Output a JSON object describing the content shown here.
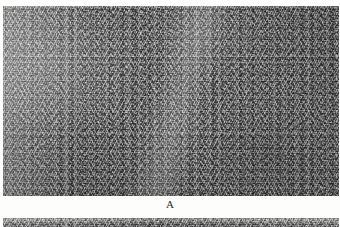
{
  "figure": {
    "kind": "histology-micrograph-figure",
    "background_color": "#fdfdfc",
    "panels": [
      {
        "id": "A",
        "label": "A",
        "role": "main-micrograph",
        "modality": "light-microscopy",
        "staining": "grayscale",
        "tissue_description": "dense interlacing spindle-cell fascicles",
        "dominant_tone": "#8a8a8a",
        "dark_tone": "#3a3a3a",
        "light_tone": "#dcdcdc",
        "bounds": {
          "x": 3,
          "y": 6,
          "width": 336,
          "height": 190
        }
      },
      {
        "id": "B",
        "label": "",
        "role": "cropped-lower-micrograph-sliver",
        "modality": "light-microscopy",
        "staining": "grayscale",
        "tissue_description": "top edge of adjacent panel, partially cut off",
        "dominant_tone": "#9a9a9a",
        "bounds": {
          "x": 3,
          "y": 218,
          "width": 336,
          "height": 9
        }
      }
    ]
  }
}
